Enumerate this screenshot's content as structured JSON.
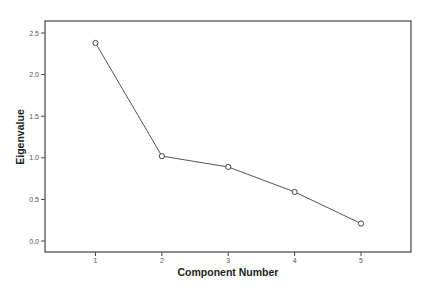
{
  "chart_data": {
    "type": "line",
    "title": "",
    "xlabel": "Component Number",
    "ylabel": "Eigenvalue",
    "categories": [
      "1",
      "2",
      "3",
      "4",
      "5"
    ],
    "x": [
      1,
      2,
      3,
      4,
      5
    ],
    "values": [
      2.38,
      1.02,
      0.89,
      0.59,
      0.21
    ],
    "series": [
      {
        "name": "Eigenvalue",
        "values": [
          2.38,
          1.02,
          0.89,
          0.59,
          0.21
        ]
      }
    ],
    "ylim": [
      -0.14,
      2.64
    ],
    "xlim": [
      0.25,
      5.75
    ],
    "yticks": [
      0.0,
      0.5,
      1.0,
      1.5,
      2.0,
      2.5
    ],
    "ytick_labels": [
      "0.0",
      "0.5",
      "1.0",
      "1.5",
      "2.0",
      "2.5"
    ],
    "xtick_labels": [
      "1",
      "2",
      "3",
      "4",
      "5"
    ],
    "grid": false,
    "legend": null,
    "marker": "open-circle"
  },
  "colors": {
    "line": "#555555",
    "frame": "#444444",
    "marker_stroke": "#444444",
    "marker_fill": "#ffffff"
  }
}
